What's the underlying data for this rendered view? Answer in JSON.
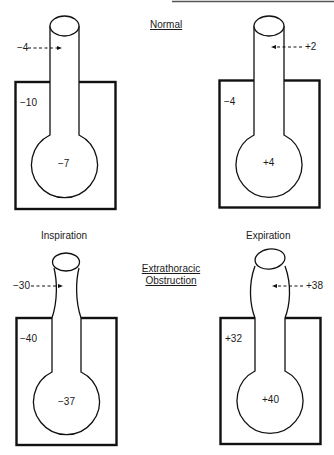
{
  "headings": {
    "normal": "Normal",
    "inspiration": "Inspiration",
    "expiration": "Expiration",
    "obstruction_line1": "Extrathoracic",
    "obstruction_line2": "Obstruction"
  },
  "panels": {
    "normal_inspiration": {
      "airway_pressure": "−4",
      "pleural_pressure": "−10",
      "alveolar_pressure": "−7"
    },
    "normal_expiration": {
      "airway_pressure": "+2",
      "pleural_pressure": "−4",
      "alveolar_pressure": "+4"
    },
    "obstruction_inspiration": {
      "airway_pressure": "−30",
      "pleural_pressure": "−40",
      "alveolar_pressure": "−37"
    },
    "obstruction_expiration": {
      "airway_pressure": "+38",
      "pleural_pressure": "+32",
      "alveolar_pressure": "+40"
    }
  },
  "colors": {
    "line": "#111111",
    "text": "#1a1a1a",
    "background": "#ffffff",
    "top_rule": "#555555"
  }
}
